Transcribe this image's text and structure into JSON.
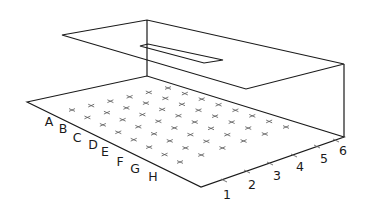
{
  "diagram": {
    "row_labels": [
      "A",
      "B",
      "C",
      "D",
      "E",
      "F",
      "G",
      "H"
    ],
    "column_labels": [
      "1",
      "2",
      "3",
      "4",
      "5",
      "6"
    ],
    "grid": {
      "rows": 8,
      "columns": 6,
      "marker": "cross"
    },
    "colors": {
      "line": "#1a1a1a",
      "marker": "#555555",
      "label": "#1a1a1a"
    }
  }
}
